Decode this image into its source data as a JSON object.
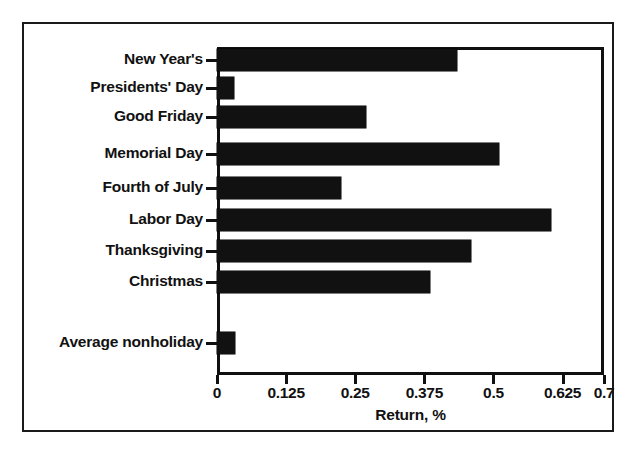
{
  "chart_data": {
    "type": "bar",
    "orientation": "horizontal",
    "title": "",
    "xlabel": "Return, %",
    "ylabel": "",
    "xlim": [
      0,
      0.7
    ],
    "grid": false,
    "legend": null,
    "xticks": [
      "0",
      "0.125",
      "0.25",
      "0.375",
      "0.5",
      "0.625",
      "0.7"
    ],
    "xtick_values": [
      0,
      0.125,
      0.25,
      0.375,
      0.5,
      0.625,
      0.7
    ],
    "categories": [
      "New Year's",
      "Presidents' Day",
      "Good Friday",
      "Memorial Day",
      "Fourth of July",
      "Labor Day",
      "Thanksgiving",
      "Christmas",
      "Average nonholiday"
    ],
    "values": [
      0.435,
      0.03,
      0.27,
      0.51,
      0.225,
      0.605,
      0.46,
      0.385,
      0.032
    ],
    "bar_color": "#111111"
  },
  "figure": {
    "frame_color": "#1a1a1a",
    "background": "#ffffff"
  }
}
